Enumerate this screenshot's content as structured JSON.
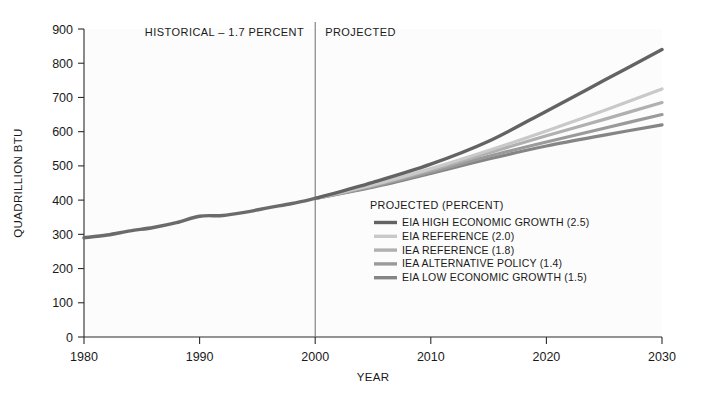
{
  "chart_data": {
    "type": "line",
    "title": "",
    "xlabel": "YEAR",
    "ylabel": "QUADRILLION BTU",
    "xlim": [
      1980,
      2030
    ],
    "ylim": [
      0,
      900
    ],
    "grid": false,
    "legend_position": "inside-right",
    "xticks": [
      "1980",
      "1990",
      "2000",
      "2010",
      "2020",
      "2030"
    ],
    "yticks": [
      "0",
      "100",
      "200",
      "300",
      "400",
      "500",
      "600",
      "700",
      "800",
      "900"
    ],
    "annotations": [
      {
        "name": "historical-band-label",
        "text": "HISTORICAL – 1.7 PERCENT"
      },
      {
        "name": "projected-band-label",
        "text": "PROJECTED"
      },
      {
        "name": "split-year",
        "value": 2000
      }
    ],
    "legend_title": "PROJECTED (PERCENT)",
    "historical": {
      "name": "HISTORICAL",
      "color": "#6b6b6b",
      "x": [
        1980,
        1982,
        1984,
        1986,
        1988,
        1990,
        1992,
        1994,
        1996,
        1998,
        2000
      ],
      "values": [
        290,
        298,
        310,
        320,
        334,
        353,
        355,
        365,
        378,
        390,
        405
      ]
    },
    "series": [
      {
        "name": "EIA HIGH ECONOMIC GROWTH (2.5)",
        "label": "EIA HIGH ECONOMIC GROWTH (2.5)",
        "percent": 2.5,
        "color": "#636363",
        "width": 3.4,
        "x": [
          2000,
          2005,
          2010,
          2015,
          2020,
          2025,
          2030
        ],
        "values": [
          405,
          452,
          505,
          572,
          660,
          750,
          840
        ]
      },
      {
        "name": "EIA REFERENCE (2.0)",
        "label": "EIA REFERENCE (2.0)",
        "percent": 2.0,
        "color": "#c9c9c9",
        "width": 3.2,
        "x": [
          2000,
          2005,
          2010,
          2015,
          2020,
          2025,
          2030
        ],
        "values": [
          405,
          445,
          492,
          545,
          602,
          662,
          725
        ]
      },
      {
        "name": "IEA REFERENCE (1.8)",
        "label": "IEA REFERENCE (1.8)",
        "percent": 1.8,
        "color": "#b0b0b0",
        "width": 3.2,
        "x": [
          2000,
          2005,
          2010,
          2015,
          2020,
          2025,
          2030
        ],
        "values": [
          405,
          443,
          488,
          538,
          588,
          636,
          685
        ]
      },
      {
        "name": "IEA ALTERNATIVE POLICY (1.4)",
        "label": "IEA ALTERNATIVE POLICY (1.4)",
        "percent": 1.4,
        "color": "#9a9a9a",
        "width": 3.2,
        "x": [
          2000,
          2005,
          2010,
          2015,
          2020,
          2025,
          2030
        ],
        "values": [
          405,
          440,
          482,
          528,
          570,
          610,
          650
        ]
      },
      {
        "name": "EIA LOW ECONOMIC GROWTH (1.5)",
        "label": "EIA LOW ECONOMIC GROWTH (1.5)",
        "percent": 1.5,
        "color": "#858585",
        "width": 3.2,
        "x": [
          2000,
          2005,
          2010,
          2015,
          2020,
          2025,
          2030
        ],
        "values": [
          405,
          438,
          478,
          520,
          558,
          590,
          620
        ]
      }
    ]
  }
}
